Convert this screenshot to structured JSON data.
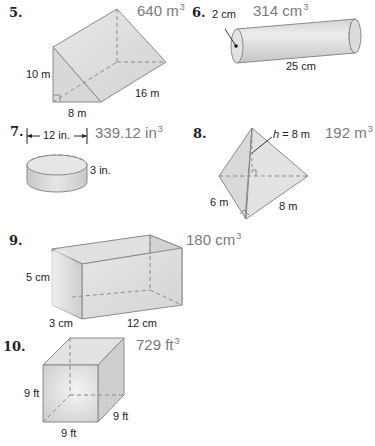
{
  "problems": [
    {
      "number": "5.",
      "shape": "triangular-prism",
      "answer_value": "640 m",
      "answer_exp": "3",
      "labels": {
        "height": "10 m",
        "base": "8 m",
        "length": "16 m"
      }
    },
    {
      "number": "6.",
      "shape": "cylinder",
      "answer_value": "314 cm",
      "answer_exp": "3",
      "labels": {
        "radius": "2 cm",
        "length": "25 cm"
      }
    },
    {
      "number": "7.",
      "shape": "cylinder",
      "answer_value": "339.12 in",
      "answer_exp": "3",
      "labels": {
        "diameter": "12 in.",
        "height": "3 in."
      }
    },
    {
      "number": "8.",
      "shape": "triangular-pyramid",
      "answer_value": "192 m",
      "answer_exp": "3",
      "labels": {
        "h_var": "h",
        "h_value": " = 8 m",
        "side_a": "6 m",
        "side_b": "8 m"
      }
    },
    {
      "number": "9.",
      "shape": "rectangular-prism",
      "answer_value": "180 cm",
      "answer_exp": "3",
      "labels": {
        "height": "5 cm",
        "width": "3 cm",
        "length": "12 cm"
      }
    },
    {
      "number": "10.",
      "shape": "cube",
      "answer_value": "729 ft",
      "answer_exp": "3",
      "labels": {
        "height": "9 ft",
        "width": "9 ft",
        "depth": "9 ft"
      }
    }
  ],
  "colors": {
    "edge": "#8a8a8a",
    "face_light": "#e4e4e4",
    "face_mid": "#d6d6d6",
    "face_dark": "#c6c6c6",
    "answer_text": "#7a7a7a"
  }
}
